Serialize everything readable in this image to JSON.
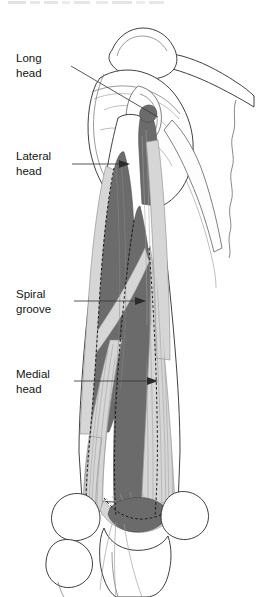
{
  "figure": {
    "title_fragment": "",
    "background_color": "#ffffff",
    "width": 256,
    "height": 597
  },
  "palette": {
    "muscle_dark": "#6b6b6b",
    "muscle_light": "#d6d6d6",
    "bone_fill": "#ffffff",
    "outline": "#2a2a2a",
    "leader_line": "#3a3a3a",
    "dashed_border": "#1c1c1c",
    "label_text": "#141414"
  },
  "labels": [
    {
      "id": "long-head",
      "line1": "Long",
      "line2": "head",
      "text_x": 16,
      "text_y1": 59,
      "text_y2": 74,
      "leader": "M 71 66 L 160 118",
      "arrow_x": 160,
      "arrow_y": 118,
      "arrow_angle": 30,
      "has_arrowhead": false
    },
    {
      "id": "lateral-head",
      "line1": "Lateral",
      "line2": "head",
      "text_x": 16,
      "text_y1": 157,
      "text_y2": 172,
      "leader": "M 72 164 L 124 164",
      "arrow_x": 126,
      "arrow_y": 164,
      "arrow_angle": 0,
      "has_arrowhead": true
    },
    {
      "id": "spiral-groove",
      "line1": "Spiral",
      "line2": "groove",
      "text_x": 16,
      "text_y1": 295,
      "text_y2": 310,
      "leader": "M 74 301 L 140 301",
      "arrow_x": 142,
      "arrow_y": 301,
      "arrow_angle": 0,
      "has_arrowhead": true
    },
    {
      "id": "medial-head",
      "line1": "Medial",
      "line2": "head",
      "text_x": 16,
      "text_y1": 375,
      "text_y2": 390,
      "leader": "M 74 381 L 152 381",
      "arrow_x": 154,
      "arrow_y": 381,
      "arrow_angle": 0,
      "has_arrowhead": true
    }
  ],
  "anatomy": {
    "structures": [
      {
        "name": "clavicle",
        "kind": "bone"
      },
      {
        "name": "acromion",
        "kind": "bone"
      },
      {
        "name": "scapula-body",
        "kind": "bone"
      },
      {
        "name": "scapula-spine",
        "kind": "bone"
      },
      {
        "name": "glenoid",
        "kind": "bone"
      },
      {
        "name": "infraglenoid-tubercle",
        "kind": "bone"
      },
      {
        "name": "humerus-shaft",
        "kind": "bone"
      },
      {
        "name": "lateral-epicondyle",
        "kind": "bone"
      },
      {
        "name": "medial-epicondyle",
        "kind": "bone"
      },
      {
        "name": "olecranon",
        "kind": "bone"
      },
      {
        "name": "ulna",
        "kind": "bone"
      },
      {
        "name": "radius",
        "kind": "bone"
      },
      {
        "name": "triceps-long-head",
        "kind": "muscle",
        "shade": "dark"
      },
      {
        "name": "triceps-lateral-head",
        "kind": "muscle",
        "shade": "dark"
      },
      {
        "name": "triceps-medial-head",
        "kind": "muscle",
        "shade": "dark"
      },
      {
        "name": "triceps-tendon",
        "kind": "tendon",
        "shade": "light"
      },
      {
        "name": "spiral-groove-band",
        "kind": "landmark",
        "shade": "light"
      }
    ]
  }
}
